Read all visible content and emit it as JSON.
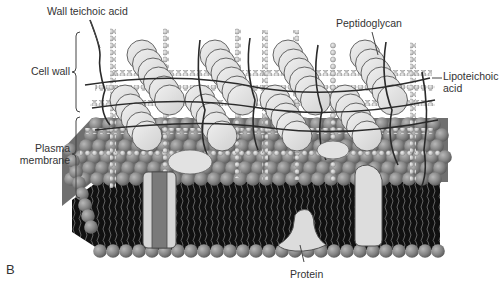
{
  "figure": {
    "panel_letter": "B",
    "labels": {
      "wall_teichoic_acid": "Wall teichoic acid",
      "cell_wall": "Cell wall",
      "plasma_membrane_line1": "Plasma",
      "plasma_membrane_line2": "membrane",
      "peptidoglycan": "Peptidoglycan",
      "lipoteichoic_acid_line1": "Lipoteichoic",
      "lipoteichoic_acid_line2": "acid",
      "protein": "Protein"
    },
    "colors": {
      "background": "#ffffff",
      "lipid_head": "#8a8a8a",
      "lipid_tail": "#1a1a1a",
      "peptidoglycan_bead": "#cfcfcf",
      "cylinder": "#e2e2e2",
      "protein": "#d8d8d8",
      "channel_core": "#7a7a7a",
      "line": "#333333",
      "text": "#333333"
    }
  }
}
